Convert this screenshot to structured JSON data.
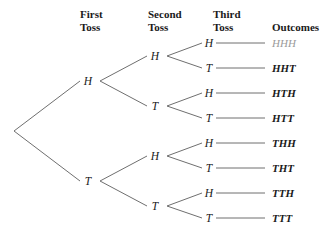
{
  "headers": [
    {
      "line1": "First",
      "line2": "Toss",
      "x": 80,
      "y": 8,
      "name": "header-first-toss"
    },
    {
      "line1": "Second",
      "line2": "Toss",
      "x": 148,
      "y": 8,
      "name": "header-second-toss"
    },
    {
      "line1": "Third",
      "line2": "Toss",
      "x": 213,
      "y": 8,
      "name": "header-third-toss"
    },
    {
      "line1": "",
      "line2": "Outcomes",
      "x": 272,
      "y": 8,
      "name": "header-outcomes"
    }
  ],
  "first_toss": [
    {
      "label": "H",
      "x": 88,
      "y": 81
    },
    {
      "label": "T",
      "x": 88,
      "y": 181
    }
  ],
  "second_toss": [
    {
      "label": "H",
      "x": 155,
      "y": 56
    },
    {
      "label": "T",
      "x": 155,
      "y": 106
    },
    {
      "label": "H",
      "x": 155,
      "y": 156
    },
    {
      "label": "T",
      "x": 155,
      "y": 206
    }
  ],
  "third_toss": [
    {
      "label": "H",
      "x": 209,
      "y": 43
    },
    {
      "label": "T",
      "x": 209,
      "y": 68
    },
    {
      "label": "H",
      "x": 209,
      "y": 93
    },
    {
      "label": "T",
      "x": 209,
      "y": 118
    },
    {
      "label": "H",
      "x": 209,
      "y": 143
    },
    {
      "label": "T",
      "x": 209,
      "y": 168
    },
    {
      "label": "H",
      "x": 209,
      "y": 193
    },
    {
      "label": "T",
      "x": 209,
      "y": 218
    }
  ],
  "outcomes": [
    {
      "label": "HHH",
      "x": 272,
      "y": 43,
      "dim": true
    },
    {
      "label": "HHT",
      "x": 272,
      "y": 68,
      "dim": false
    },
    {
      "label": "HTH",
      "x": 272,
      "y": 93,
      "dim": false
    },
    {
      "label": "HTT",
      "x": 272,
      "y": 118,
      "dim": false
    },
    {
      "label": "THH",
      "x": 272,
      "y": 143,
      "dim": false
    },
    {
      "label": "THT",
      "x": 272,
      "y": 168,
      "dim": false
    },
    {
      "label": "TTH",
      "x": 272,
      "y": 193,
      "dim": false
    },
    {
      "label": "TTT",
      "x": 272,
      "y": 218,
      "dim": false
    }
  ],
  "edges": {
    "stroke": "#6f6f6f",
    "width": 1,
    "root": {
      "x": 14,
      "y": 131
    },
    "segments": [
      {
        "x1": 14,
        "y1": 131,
        "x2": 80,
        "y2": 81,
        "name": "edge-root-to-h"
      },
      {
        "x1": 14,
        "y1": 131,
        "x2": 80,
        "y2": 181,
        "name": "edge-root-to-t"
      },
      {
        "x1": 100,
        "y1": 81,
        "x2": 147,
        "y2": 56,
        "name": "edge-h-to-hh"
      },
      {
        "x1": 100,
        "y1": 81,
        "x2": 147,
        "y2": 106,
        "name": "edge-h-to-ht"
      },
      {
        "x1": 100,
        "y1": 181,
        "x2": 147,
        "y2": 156,
        "name": "edge-t-to-th"
      },
      {
        "x1": 100,
        "y1": 181,
        "x2": 147,
        "y2": 206,
        "name": "edge-t-to-tt"
      },
      {
        "x1": 167,
        "y1": 56,
        "x2": 202,
        "y2": 43,
        "name": "edge-hh-to-hhh"
      },
      {
        "x1": 167,
        "y1": 56,
        "x2": 202,
        "y2": 68,
        "name": "edge-hh-to-hht"
      },
      {
        "x1": 167,
        "y1": 106,
        "x2": 202,
        "y2": 93,
        "name": "edge-ht-to-hth"
      },
      {
        "x1": 167,
        "y1": 106,
        "x2": 202,
        "y2": 118,
        "name": "edge-ht-to-htt"
      },
      {
        "x1": 167,
        "y1": 156,
        "x2": 202,
        "y2": 143,
        "name": "edge-th-to-thh"
      },
      {
        "x1": 167,
        "y1": 156,
        "x2": 202,
        "y2": 168,
        "name": "edge-th-to-tht"
      },
      {
        "x1": 167,
        "y1": 206,
        "x2": 202,
        "y2": 193,
        "name": "edge-tt-to-tth"
      },
      {
        "x1": 167,
        "y1": 206,
        "x2": 202,
        "y2": 218,
        "name": "edge-tt-to-ttt"
      },
      {
        "x1": 216,
        "y1": 43,
        "x2": 265,
        "y2": 43,
        "name": "connector-hhh"
      },
      {
        "x1": 216,
        "y1": 68,
        "x2": 265,
        "y2": 68,
        "name": "connector-hht"
      },
      {
        "x1": 216,
        "y1": 93,
        "x2": 265,
        "y2": 93,
        "name": "connector-hth"
      },
      {
        "x1": 216,
        "y1": 118,
        "x2": 265,
        "y2": 118,
        "name": "connector-htt"
      },
      {
        "x1": 216,
        "y1": 143,
        "x2": 265,
        "y2": 143,
        "name": "connector-thh"
      },
      {
        "x1": 216,
        "y1": 168,
        "x2": 265,
        "y2": 168,
        "name": "connector-tht"
      },
      {
        "x1": 216,
        "y1": 193,
        "x2": 265,
        "y2": 193,
        "name": "connector-tth"
      },
      {
        "x1": 216,
        "y1": 218,
        "x2": 265,
        "y2": 218,
        "name": "connector-ttt"
      }
    ]
  }
}
